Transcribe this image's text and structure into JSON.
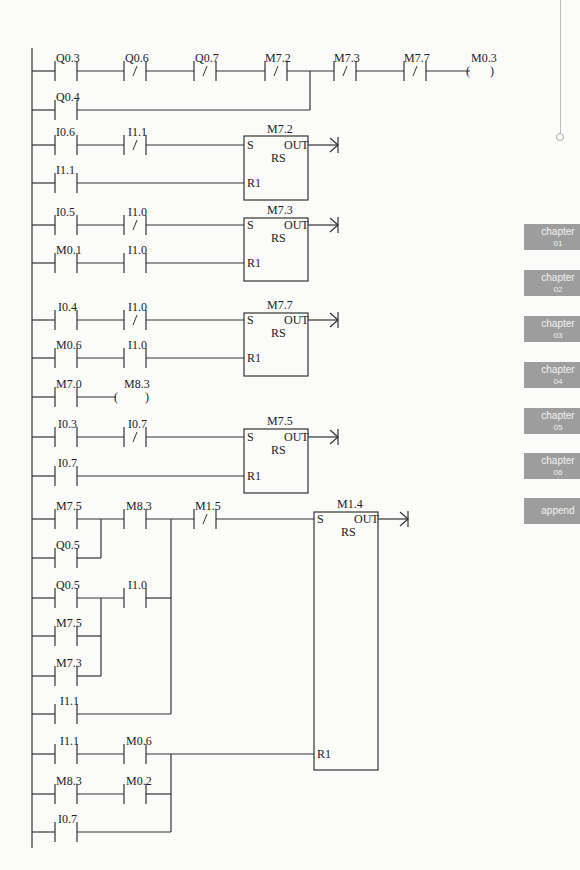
{
  "ladder": {
    "rung1": {
      "contacts": [
        {
          "label": "Q0.3",
          "type": "NO"
        },
        {
          "label": "Q0.6",
          "type": "NC"
        },
        {
          "label": "Q0.7",
          "type": "NC"
        },
        {
          "label": "M7.2",
          "type": "NC"
        },
        {
          "label": "M7.3",
          "type": "NC"
        },
        {
          "label": "M7.7",
          "type": "NC"
        }
      ],
      "parallel": {
        "label": "Q0.4",
        "type": "NO"
      },
      "coil": "M0.3"
    },
    "rs_blocks": [
      {
        "name": "M7.2",
        "s_label": "S",
        "out_label": "OUT",
        "type_label": "RS",
        "r_label": "R1",
        "set": [
          {
            "label": "I0.6",
            "type": "NO"
          },
          {
            "label": "I1.1",
            "type": "NC"
          }
        ],
        "reset": [
          {
            "label": "I1.1",
            "type": "NO"
          }
        ]
      },
      {
        "name": "M7.3",
        "s_label": "S",
        "out_label": "OUT",
        "type_label": "RS",
        "r_label": "R1",
        "set": [
          {
            "label": "I0.5",
            "type": "NO"
          },
          {
            "label": "I1.0",
            "type": "NC"
          }
        ],
        "reset": [
          {
            "label": "M0.1",
            "type": "NO"
          },
          {
            "label": "I1.0",
            "type": "NO"
          }
        ]
      },
      {
        "name": "M7.7",
        "s_label": "S",
        "out_label": "OUT",
        "type_label": "RS",
        "r_label": "R1",
        "set": [
          {
            "label": "I0.4",
            "type": "NO"
          },
          {
            "label": "I1.0",
            "type": "NC"
          }
        ],
        "reset": [
          {
            "label": "M0.6",
            "type": "NO"
          },
          {
            "label": "I1.0",
            "type": "NO"
          }
        ]
      },
      {
        "name": "M7.5",
        "s_label": "S",
        "out_label": "OUT",
        "type_label": "RS",
        "r_label": "R1",
        "set": [
          {
            "label": "I0.3",
            "type": "NO"
          },
          {
            "label": "I0.7",
            "type": "NC"
          }
        ],
        "reset": [
          {
            "label": "I0.7",
            "type": "NO"
          }
        ]
      }
    ],
    "coil_rung": {
      "contact": "M7.0",
      "coil": "M8.3"
    },
    "big_rung": {
      "block": {
        "name": "M1.4",
        "s_label": "S",
        "out_label": "OUT",
        "type_label": "RS",
        "r_label": "R1"
      },
      "set_contacts": {
        "m75": "M7.5",
        "q05a": "Q0.5",
        "m83": "M8.3",
        "m15": "M1.5",
        "q05b": "Q0.5",
        "i10": "I1.0",
        "m75b": "M7.5",
        "m73": "M7.3",
        "i11": "I1.1"
      },
      "reset_contacts": {
        "i11": "I1.1",
        "m06": "M0.6",
        "m83": "M8.3",
        "m02": "M0.2",
        "i07": "I0.7"
      }
    }
  },
  "sidebar_tabs": [
    {
      "label": "chapter",
      "num": "01"
    },
    {
      "label": "chapter",
      "num": "02"
    },
    {
      "label": "chapter",
      "num": "03"
    },
    {
      "label": "chapter",
      "num": "04"
    },
    {
      "label": "chapter",
      "num": "05"
    },
    {
      "label": "chapter",
      "num": "06"
    },
    {
      "label": "append",
      "num": ""
    }
  ]
}
